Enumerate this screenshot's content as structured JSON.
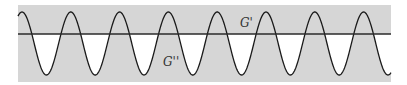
{
  "diagram": {
    "labels": {
      "upper": "G'",
      "lower": "G''"
    },
    "colors": {
      "background": "#d6d6d6",
      "curve": "#1a1a1a",
      "line": "#2a2a2a",
      "cutout": "#ffffff"
    },
    "wave": {
      "peaks": 8,
      "period_px": 48.8,
      "baseline_y": 34,
      "peak_y": 12,
      "trough_y": 75
    }
  }
}
